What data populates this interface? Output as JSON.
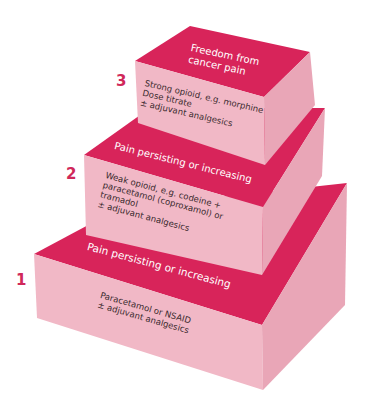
{
  "colors": {
    "top_face": "#d8245a",
    "front_face": "#f1b8c6",
    "side_face": "#e9a6b7",
    "number": "#d0285a"
  },
  "steps": [
    {
      "number": "1",
      "top_label": "Pain persisting or increasing",
      "body": [
        "Paracetamol or NSAID",
        "± adjuvant analgesics"
      ]
    },
    {
      "number": "2",
      "top_label": "Pain persisting or increasing",
      "body": [
        "Weak opioid, e.g. codeine +",
        "paracetamol (coproxamol) or",
        "tramadol",
        "± adjuvant analgesics"
      ]
    },
    {
      "number": "3",
      "top_label_lines": [
        "Freedom from",
        "cancer pain"
      ],
      "body": [
        "Strong opioid, e.g. morphine",
        "Dose titrate",
        "± adjuvant analgesics"
      ]
    }
  ]
}
